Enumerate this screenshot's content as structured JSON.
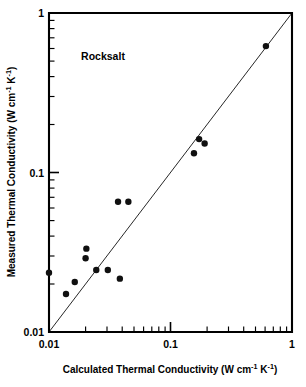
{
  "chart_data": {
    "type": "scatter",
    "title": "",
    "annotation": "Rocksalt",
    "xlabel": "Calculated Thermal Conductivity (W cm",
    "xlabel_sup1": "-1",
    "xlabel_mid": " K",
    "xlabel_sup2": "-1",
    "xlabel_end": ")",
    "ylabel": "Measured Thermal Conductivity (W cm",
    "ylabel_sup1": "-1",
    "ylabel_mid": " K",
    "ylabel_sup2": "-1",
    "ylabel_end": ")",
    "xscale": "log",
    "yscale": "log",
    "xlim": [
      0.01,
      1
    ],
    "ylim": [
      0.01,
      1
    ],
    "grid": false,
    "legend": "none",
    "xticks": [
      {
        "value": 0.01,
        "label": "0.01"
      },
      {
        "value": 0.1,
        "label": "0.1"
      },
      {
        "value": 1,
        "label": "1"
      }
    ],
    "yticks": [
      {
        "value": 0.01,
        "label": "0.01"
      },
      {
        "value": 0.1,
        "label": "0.1"
      },
      {
        "value": 1,
        "label": "1"
      }
    ],
    "reference_line": {
      "name": "parity-line",
      "description": "y = x one-to-one line",
      "from": [
        0.01,
        0.01
      ],
      "to": [
        1.0,
        1.0
      ]
    },
    "series": [
      {
        "name": "Rocksalt compounds",
        "marker": "filled-circle",
        "marker_color": "#101010",
        "marker_size_px": 6.4,
        "points": [
          {
            "x": 0.01,
            "y": 0.0235
          },
          {
            "x": 0.0138,
            "y": 0.0173
          },
          {
            "x": 0.0163,
            "y": 0.0206
          },
          {
            "x": 0.02,
            "y": 0.029
          },
          {
            "x": 0.0203,
            "y": 0.0333
          },
          {
            "x": 0.0245,
            "y": 0.0245
          },
          {
            "x": 0.0305,
            "y": 0.0245
          },
          {
            "x": 0.037,
            "y": 0.0655
          },
          {
            "x": 0.0383,
            "y": 0.0216
          },
          {
            "x": 0.045,
            "y": 0.0655
          },
          {
            "x": 0.156,
            "y": 0.132
          },
          {
            "x": 0.172,
            "y": 0.162
          },
          {
            "x": 0.191,
            "y": 0.152
          },
          {
            "x": 0.61,
            "y": 0.62
          }
        ]
      }
    ]
  },
  "colors": {
    "axis": "#000000",
    "marker": "#101010",
    "parity_line": "#1b1b1b",
    "background": "#ffffff"
  }
}
